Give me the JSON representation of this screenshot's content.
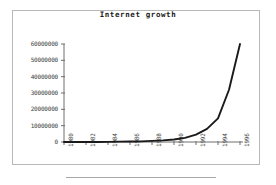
{
  "frame": {
    "border_color": "#b8b8b8",
    "background": "#ffffff"
  },
  "bottom_rule": {
    "color": "#a8a8a8"
  },
  "chart_data": {
    "type": "line",
    "title": "Internet growth",
    "xlabel": "",
    "ylabel": "",
    "grid": false,
    "legend": null,
    "line_color": "#1a1a1a",
    "xlim": [
      1980,
      1996
    ],
    "ylim": [
      0,
      60000000
    ],
    "x_tick_labels": [
      "1980",
      "1982",
      "1984",
      "1986",
      "1988",
      "1990",
      "1992",
      "1994",
      "1996"
    ],
    "x_tick_values": [
      1980,
      1982,
      1984,
      1986,
      1988,
      1990,
      1992,
      1994,
      1996
    ],
    "y_tick_labels": [
      "0",
      "10000000",
      "20000000",
      "30000000",
      "40000000",
      "50000000",
      "60000000"
    ],
    "y_tick_values": [
      0,
      10000000,
      20000000,
      30000000,
      40000000,
      50000000,
      60000000
    ],
    "x": [
      1980,
      1981,
      1982,
      1983,
      1984,
      1985,
      1986,
      1987,
      1988,
      1989,
      1990,
      1991,
      1992,
      1993,
      1994,
      1995,
      1996
    ],
    "values": [
      0,
      0,
      0,
      0,
      100000,
      200000,
      300000,
      400000,
      700000,
      1000000,
      1500000,
      2500000,
      4500000,
      8000000,
      14500000,
      32000000,
      60000000
    ],
    "series": [
      {
        "name": "Internet hosts",
        "values": [
          0,
          0,
          0,
          0,
          100000,
          200000,
          300000,
          400000,
          700000,
          1000000,
          1500000,
          2500000,
          4500000,
          8000000,
          14500000,
          32000000,
          60000000
        ]
      }
    ]
  }
}
